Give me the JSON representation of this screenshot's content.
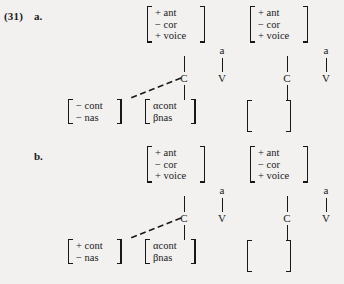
{
  "example": {
    "number": "(31)",
    "items": [
      {
        "letter": "a.",
        "left_derivation": {
          "root_matrix": {
            "features": [
              "+ ant",
              "− cor",
              "+ voice"
            ]
          },
          "c_node": "C",
          "v_node": "V",
          "vowel_melody": "a",
          "target_matrix": {
            "features": [
              "− cont",
              "− nas"
            ]
          },
          "alpha_matrix": {
            "features": [
              "αcont",
              "βnas"
            ]
          }
        },
        "right_derivation": {
          "root_matrix": {
            "features": [
              "+ ant",
              "− cor",
              "+ voice"
            ]
          },
          "c_node": "C",
          "v_node": "V",
          "vowel_melody": "a",
          "empty_matrix": {
            "features": []
          }
        }
      },
      {
        "letter": "b.",
        "left_derivation": {
          "root_matrix": {
            "features": [
              "+ ant",
              "− cor",
              "+ voice"
            ]
          },
          "c_node": "C",
          "v_node": "V",
          "vowel_melody": "a",
          "target_matrix": {
            "features": [
              "+ cont",
              "− nas"
            ]
          },
          "alpha_matrix": {
            "features": [
              "αcont",
              "βnas"
            ]
          }
        },
        "right_derivation": {
          "root_matrix": {
            "features": [
              "+ ant",
              "− cor",
              "+ voice"
            ]
          },
          "c_node": "C",
          "v_node": "V",
          "vowel_melody": "a",
          "empty_matrix": {
            "features": []
          }
        }
      }
    ]
  },
  "style": {
    "ink": "#181818",
    "paper": "#f2f1ef"
  }
}
